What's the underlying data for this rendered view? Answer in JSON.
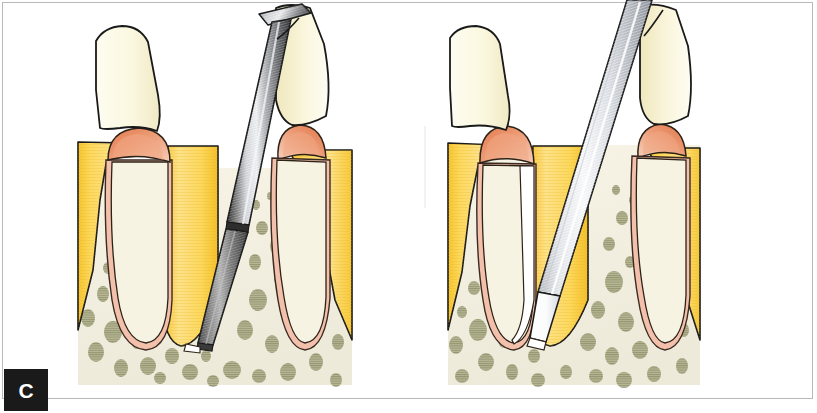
{
  "figure": {
    "caption_letter": "C",
    "panel_count": 2,
    "background_color": "#ffffff",
    "frame_color": "#b9b9b9"
  },
  "palette": {
    "crown_enamel": "#fbf8e3",
    "crown_enamel_shade": "#f2ecc9",
    "gingiva_yellow": "#fbd24e",
    "gingiva_yellow_dark": "#f0bd2e",
    "gingiva_yellow_light": "#fde387",
    "papilla_salmon": "#e8845a",
    "papilla_salmon_light": "#f2b59a",
    "pdl_pink": "#f2bda8",
    "bone_cream": "#f4f1e0",
    "bone_trabecula": "#9a9b72",
    "instrument_steel_dark": "#5c5c5c",
    "instrument_steel_mid": "#9b9b9b",
    "instrument_steel_light": "#e9ecef",
    "blade_white": "#ffffff",
    "outline_black": "#1a1a1a",
    "caption_background": "#1a1a1a",
    "caption_text": "#ffffff"
  },
  "panels": [
    {
      "id": "panel-left",
      "name": "chisel-osteotome-panel",
      "label": "Left panel — osteotome/chisel luxation",
      "instrument": {
        "name": "osteotome-chisel",
        "type": "straight chisel with flared T handle",
        "shaft_finish": "polished steel with longitudinal striations",
        "tip_finish": "dark matte working tip below collar"
      },
      "anatomy": [
        "tooth-crown",
        "adjacent-tooth-crown",
        "gingiva",
        "interdental-papilla",
        "periodontal-ligament",
        "tooth-root",
        "alveolar-bone",
        "trabecular-bone"
      ]
    },
    {
      "id": "panel-right",
      "name": "periotome-panel",
      "label": "Right panel — periotome blade severing ligament",
      "instrument": {
        "name": "periotome-blade",
        "type": "thin tapered periotome blade",
        "shaft_finish": "bright silver with pale highlight",
        "tip_finish": "thin white blade edge in the ligament space"
      },
      "anatomy": [
        "tooth-crown",
        "adjacent-tooth-crown",
        "gingiva",
        "interdental-papilla",
        "separated-ligament-space",
        "tooth-root",
        "alveolar-bone",
        "trabecular-bone"
      ]
    }
  ]
}
